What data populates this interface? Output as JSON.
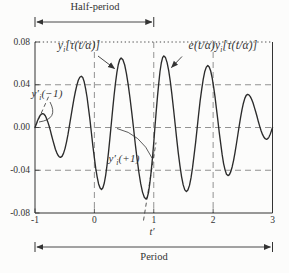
{
  "figure": {
    "background": "#fcfcfb",
    "ink_color": "#333333",
    "grid_color": "#777777"
  },
  "chart_data": {
    "type": "line",
    "title": "",
    "xlabel": "t′",
    "ylabel": "",
    "xlim": [
      -1,
      3
    ],
    "ylim": [
      -0.08,
      0.08
    ],
    "grid": {
      "h_dashed": [
        0.04,
        0,
        -0.04
      ],
      "v_dashed": [
        0,
        1,
        2
      ],
      "top_dotted": 0.08
    },
    "x_ticks": {
      "values": [
        -1,
        0,
        1,
        2,
        3
      ],
      "labels": [
        "-1",
        "0",
        "1",
        "2",
        "3"
      ]
    },
    "y_ticks": {
      "values": [
        0.08,
        0.04,
        0,
        -0.04,
        -0.08
      ],
      "labels": [
        "0.08",
        "0.04",
        "0.00",
        "-0.04",
        "-0.08"
      ]
    },
    "series": [
      {
        "name": "e(t/α)yᵢ[τ(t/α)]",
        "keypoints": [
          [
            -1,
            0
          ],
          [
            -0.87,
            0.013
          ],
          [
            -0.57,
            -0.028
          ],
          [
            -0.22,
            0.048
          ],
          [
            0.12,
            -0.058
          ],
          [
            0.45,
            0.065
          ],
          [
            0.87,
            -0.067
          ],
          [
            1.17,
            0.067
          ],
          [
            1.55,
            -0.06
          ],
          [
            1.91,
            0.058
          ],
          [
            2.25,
            -0.045
          ],
          [
            2.58,
            0.031
          ],
          [
            2.9,
            -0.011
          ],
          [
            3,
            0
          ]
        ]
      }
    ],
    "annotations": {
      "curve_label_left": {
        "base": "y",
        "sub": "i",
        "rest": "[τ(t/α)]"
      },
      "curve_label_right": {
        "base": "e(t/α)y",
        "sub": "i",
        "rest": "[τ(t/α)]"
      },
      "slope_left": {
        "base": "y′",
        "sub": "i",
        "rest": "(−1)"
      },
      "slope_right": {
        "base": "y′",
        "sub": "i",
        "rest": "(+1)"
      },
      "half_period": {
        "label": "Half-period",
        "from": -1,
        "to": 1
      },
      "period": {
        "label": "Period",
        "from": -1,
        "to": 3
      },
      "tangent_slopes_at": [
        -1,
        1
      ]
    }
  }
}
